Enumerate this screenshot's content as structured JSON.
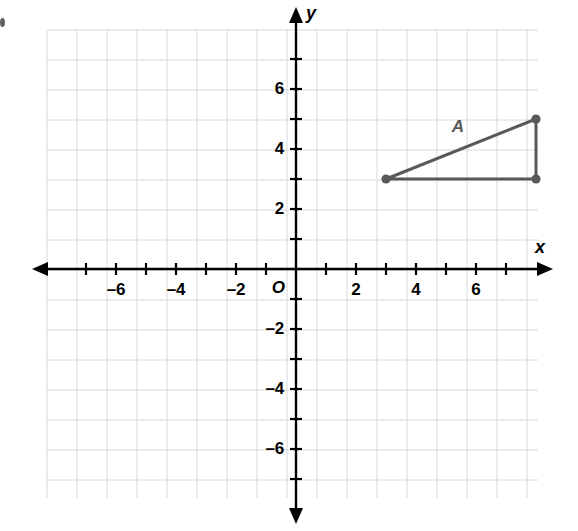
{
  "figure": {
    "kind": "coordinate-plane",
    "background_color": "#ffffff",
    "axis_color": "#000000",
    "grid_color": "#d8d8d8",
    "shape_color": "#58595b"
  },
  "axes": {
    "x_name": "x",
    "y_name": "y",
    "origin_label": "O",
    "x_ticks": [
      {
        "value": -7,
        "label": ""
      },
      {
        "value": -6,
        "label": "–6"
      },
      {
        "value": -5,
        "label": ""
      },
      {
        "value": -4,
        "label": "–4"
      },
      {
        "value": -3,
        "label": ""
      },
      {
        "value": -2,
        "label": "–2"
      },
      {
        "value": -1,
        "label": ""
      },
      {
        "value": 1,
        "label": ""
      },
      {
        "value": 2,
        "label": "2"
      },
      {
        "value": 3,
        "label": ""
      },
      {
        "value": 4,
        "label": "4"
      },
      {
        "value": 5,
        "label": ""
      },
      {
        "value": 6,
        "label": "6"
      },
      {
        "value": 7,
        "label": ""
      }
    ],
    "y_ticks": [
      {
        "value": 7,
        "label": ""
      },
      {
        "value": 6,
        "label": "6"
      },
      {
        "value": 5,
        "label": ""
      },
      {
        "value": 4,
        "label": "4"
      },
      {
        "value": 3,
        "label": ""
      },
      {
        "value": 2,
        "label": "2"
      },
      {
        "value": 1,
        "label": ""
      },
      {
        "value": -1,
        "label": ""
      },
      {
        "value": -2,
        "label": "–2"
      },
      {
        "value": -3,
        "label": ""
      },
      {
        "value": -4,
        "label": "–4"
      },
      {
        "value": -5,
        "label": ""
      },
      {
        "value": -6,
        "label": "–6"
      },
      {
        "value": -7,
        "label": ""
      }
    ]
  },
  "chart_data": {
    "type": "scatter",
    "title": "",
    "xlabel": "x",
    "ylabel": "y",
    "xlim": [
      -8.3,
      8.6
    ],
    "ylim": [
      -7.7,
      8.7
    ],
    "grid": true,
    "legend": null,
    "units_per_grid_square": 1,
    "shapes": [
      {
        "name": "triangle-A",
        "label": "A",
        "label_position": {
          "x": 5.4,
          "y": 4.75
        },
        "closed": true,
        "vertices": [
          {
            "x": 3,
            "y": 3
          },
          {
            "x": 8,
            "y": 5
          },
          {
            "x": 8,
            "y": 3
          }
        ],
        "vertex_markers": true,
        "stroke": "#58595b",
        "fill": "none"
      }
    ]
  }
}
